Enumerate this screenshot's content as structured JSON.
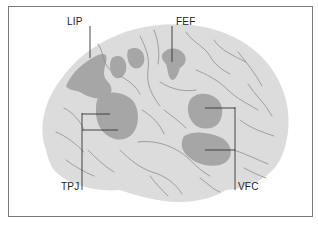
{
  "figure": {
    "type": "brain-lateral-view",
    "labels": [
      {
        "id": "lip",
        "text": "LIP"
      },
      {
        "id": "fef",
        "text": "FEF"
      },
      {
        "id": "tpj",
        "text": "TPJ"
      },
      {
        "id": "vfc",
        "text": "VFC"
      }
    ],
    "colors": {
      "brain_fill": "#dcdcdc",
      "region_fill": "#a6a6a6",
      "sulci": "#8e8e8e",
      "leader_lines": "#333333",
      "frame": "#7a7a7a"
    }
  }
}
